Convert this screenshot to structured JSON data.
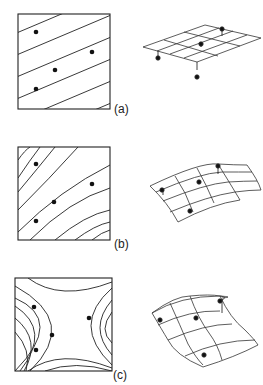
{
  "figure": {
    "top_cutoff_text": "· ·· ·     ··· ·",
    "panels": [
      {
        "id": "a",
        "label": "(a)",
        "description": "Linear trend surface: parallel straight contour lines with 4 data points; right side shows flat planar mesh with points above/below",
        "box": {
          "x": 18,
          "y": 14,
          "w": 92,
          "h": 95
        },
        "points": [
          [
            36,
            32
          ],
          [
            92,
            52
          ],
          [
            55,
            70
          ],
          [
            36,
            89
          ]
        ],
        "surface_type": "plane"
      },
      {
        "id": "b",
        "label": "(b)",
        "description": "Quadratic trend surface: curved contour lines with 4 data points; right side shows singly-curved mesh",
        "box": {
          "x": 18,
          "y": 147,
          "w": 92,
          "h": 93
        },
        "points": [
          [
            36,
            164
          ],
          [
            92,
            184
          ],
          [
            54,
            202
          ],
          [
            36,
            221
          ]
        ],
        "surface_type": "quadratic"
      },
      {
        "id": "c",
        "label": "(c)",
        "description": "Cubic trend surface: saddle-shaped contour lines with 4 data points; right side shows twisted mesh",
        "box": {
          "x": 15,
          "y": 278,
          "w": 97,
          "h": 93
        },
        "points": [
          [
            34,
            307
          ],
          [
            89,
            318
          ],
          [
            52,
            335
          ],
          [
            36,
            350
          ]
        ],
        "surface_type": "cubic"
      }
    ]
  }
}
